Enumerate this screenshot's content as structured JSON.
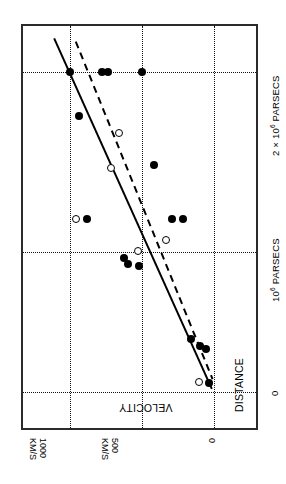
{
  "figure": {
    "kind": "velocity-distance-diagram",
    "orientation_note": "chart rendered rotated 90 degrees counter-clockwise",
    "frame_color": "#2b2b2b",
    "grid_color": "#111111",
    "marker_color": "#000000"
  },
  "axes": {
    "velocity": {
      "title": "VELOCITY",
      "ticks": [
        {
          "value": 1000,
          "label": "1000",
          "unit": "KM/S"
        },
        {
          "value": 500,
          "label": "500",
          "unit": "KM/S"
        },
        {
          "value": 0,
          "label": "0",
          "unit": ""
        }
      ],
      "range": [
        -200,
        1200
      ]
    },
    "distance": {
      "title": "DISTANCE",
      "ticks": [
        {
          "value": 0,
          "label": "0"
        },
        {
          "value": 1000000,
          "label": "10",
          "exp": "6",
          "unit": "PARSECS"
        },
        {
          "value": 2000000,
          "label": "2 × 10",
          "exp": "6",
          "unit": "PARSECS"
        }
      ],
      "range": [
        -120000,
        2350000
      ]
    }
  },
  "chart_data": {
    "type": "scatter",
    "title": "",
    "xlabel": "DISTANCE",
    "ylabel": "VELOCITY",
    "xlim": [
      -120000,
      2350000
    ],
    "ylim": [
      -200,
      1200
    ],
    "grid": true,
    "legend": [],
    "series": [
      {
        "name": "individual nebulae",
        "marker": "filled-circle",
        "color": "#000000",
        "points": [
          {
            "distance": 2000000,
            "velocity": 1000
          },
          {
            "distance": 2000000,
            "velocity": 780
          },
          {
            "distance": 2000000,
            "velocity": 735
          },
          {
            "distance": 2000000,
            "velocity": 500
          },
          {
            "distance": 1725000,
            "velocity": 940
          },
          {
            "distance": 1420000,
            "velocity": 420
          },
          {
            "distance": 1080000,
            "velocity": 880
          },
          {
            "distance": 1080000,
            "velocity": 290
          },
          {
            "distance": 1080000,
            "velocity": 215
          },
          {
            "distance": 840000,
            "velocity": 625
          },
          {
            "distance": 800000,
            "velocity": 600
          },
          {
            "distance": 790000,
            "velocity": 520
          },
          {
            "distance": 330000,
            "velocity": 160
          },
          {
            "distance": 285000,
            "velocity": 95
          },
          {
            "distance": 270000,
            "velocity": 55
          },
          {
            "distance": 55000,
            "velocity": 35
          }
        ]
      },
      {
        "name": "grouped nebulae",
        "marker": "open-circle",
        "color": "#000000",
        "points": [
          {
            "distance": 1620000,
            "velocity": 660
          },
          {
            "distance": 1400000,
            "velocity": 715
          },
          {
            "distance": 1080000,
            "velocity": 960
          },
          {
            "distance": 880000,
            "velocity": 530
          },
          {
            "distance": 950000,
            "velocity": 330
          },
          {
            "distance": 60000,
            "velocity": 105
          }
        ]
      }
    ],
    "fits": [
      {
        "name": "individual-nebulae-fit",
        "style": "solid",
        "endpoints": [
          {
            "distance": 2210000,
            "velocity": 1110
          },
          {
            "distance": 20000,
            "velocity": 15
          }
        ]
      },
      {
        "name": "grouped-nebulae-fit",
        "style": "dashed",
        "endpoints": [
          {
            "distance": 2190000,
            "velocity": 960
          },
          {
            "distance": 80000,
            "velocity": 10
          }
        ]
      }
    ]
  }
}
